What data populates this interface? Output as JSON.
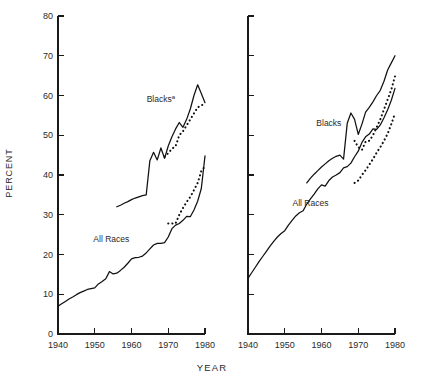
{
  "figure": {
    "width": 424,
    "height": 383,
    "background": "#ffffff",
    "ink_color": "#111111",
    "text_color": "#2a2a2a"
  },
  "axes": {
    "ylabel": "PERCENT",
    "xlabel": "YEAR",
    "ytick_labels": [
      "0",
      "10",
      "20",
      "30",
      "40",
      "50",
      "60",
      "70",
      "80"
    ],
    "xtick_labels": [
      "1940",
      "1950",
      "1960",
      "1970",
      "1980"
    ],
    "ylim": [
      0,
      80
    ],
    "xlim": [
      1940,
      1980
    ],
    "ystep": 10,
    "xstep": 10,
    "grid": false,
    "tick_side": "inside-left",
    "panels": 2
  },
  "geometry": {
    "left_panel": {
      "x0": 58,
      "x1": 205,
      "y_top": 16,
      "y_bottom": 334
    },
    "right_panel": {
      "x0": 248,
      "x1": 395,
      "y_top": 16,
      "y_bottom": 334
    },
    "tick_length": 6
  },
  "chart_data": {
    "type": "line",
    "title": "",
    "subtitle": "",
    "xlabel": "YEAR",
    "ylabel": "PERCENT",
    "xlim": [
      1940,
      1980
    ],
    "ylim": [
      0,
      80
    ],
    "grid": false,
    "legend": "inline-annotations",
    "panels": [
      {
        "panel_id": "left",
        "panel_label": "",
        "annotations": [
          {
            "text": "Blacks",
            "superscript": "a",
            "x": 1968.0,
            "y": 59.0
          },
          {
            "text": "All Races",
            "superscript": "",
            "x": 1954.5,
            "y": 24.0
          }
        ],
        "series": [
          {
            "name": "All Races",
            "style": "solid",
            "x": [
              1940,
              1941,
              1942,
              1943,
              1944,
              1945,
              1946,
              1947,
              1948,
              1949,
              1950,
              1951,
              1952,
              1953,
              1954,
              1955,
              1956,
              1957,
              1958,
              1959,
              1960,
              1961,
              1962,
              1963,
              1964,
              1965,
              1966,
              1967,
              1968,
              1969,
              1970,
              1971,
              1972,
              1973,
              1974,
              1975,
              1976,
              1977,
              1978,
              1979,
              1980
            ],
            "y": [
              7.0,
              7.6,
              8.2,
              8.8,
              9.3,
              9.9,
              10.4,
              10.8,
              11.2,
              11.4,
              11.6,
              12.6,
              13.2,
              13.9,
              15.7,
              15.1,
              15.3,
              16.0,
              16.8,
              17.8,
              18.9,
              19.2,
              19.3,
              19.6,
              20.4,
              21.4,
              22.4,
              22.8,
              22.8,
              23.0,
              24.4,
              26.5,
              27.4,
              27.8,
              28.6,
              29.6,
              29.5,
              31.2,
              33.4,
              36.6,
              44.8
            ]
          },
          {
            "name": "All Races (alternate/revised)",
            "style": "dotted",
            "x": [
              1970,
              1971,
              1972,
              1973,
              1974,
              1975,
              1976,
              1977,
              1978,
              1979,
              1980
            ],
            "y": [
              27.8,
              27.8,
              27.8,
              30.0,
              31.7,
              33.2,
              34.5,
              36.2,
              38.0,
              41.0,
              42.2
            ]
          },
          {
            "name": "Blacks",
            "style": "solid",
            "x": [
              1956,
              1957,
              1958,
              1959,
              1960,
              1961,
              1962,
              1963,
              1964,
              1965,
              1966,
              1967,
              1968,
              1969,
              1970,
              1971,
              1972,
              1973,
              1974,
              1975,
              1976,
              1977,
              1978,
              1979,
              1980
            ],
            "y": [
              32.0,
              32.4,
              32.9,
              33.3,
              33.8,
              34.2,
              34.5,
              34.8,
              35.0,
              43.6,
              45.7,
              43.8,
              46.8,
              44.2,
              47.3,
              49.6,
              51.6,
              53.2,
              52.0,
              54.0,
              56.6,
              60.0,
              62.7,
              60.5,
              58.2
            ]
          },
          {
            "name": "Blacks (alternate/revised)",
            "style": "dotted",
            "x": [
              1969,
              1970,
              1971,
              1972,
              1973,
              1974,
              1975,
              1976,
              1977,
              1978,
              1979,
              1980
            ],
            "y": [
              44.6,
              45.5,
              46.6,
              47.2,
              50.0,
              51.0,
              52.5,
              54.0,
              55.5,
              57.0,
              57.6,
              57.6
            ]
          }
        ]
      },
      {
        "panel_id": "right",
        "panel_label": "",
        "annotations": [
          {
            "text": "Blacks",
            "superscript": "",
            "x": 1962.0,
            "y": 53.0
          },
          {
            "text": "All Races",
            "superscript": "",
            "x": 1957.0,
            "y": 33.0
          }
        ],
        "series": [
          {
            "name": "All Races",
            "style": "solid",
            "x": [
              1940,
              1941,
              1942,
              1943,
              1944,
              1945,
              1946,
              1947,
              1948,
              1949,
              1950,
              1951,
              1952,
              1953,
              1954,
              1955,
              1956,
              1957,
              1958,
              1959,
              1960,
              1961,
              1962,
              1963,
              1964,
              1965,
              1966,
              1967,
              1968,
              1969,
              1970,
              1971,
              1972,
              1973,
              1974,
              1975,
              1976,
              1977,
              1978,
              1979,
              1980
            ],
            "y": [
              14.0,
              15.4,
              16.8,
              18.2,
              19.5,
              20.8,
              22.1,
              23.3,
              24.4,
              25.3,
              26.0,
              27.4,
              28.6,
              29.7,
              30.5,
              31.0,
              32.7,
              34.0,
              35.2,
              36.5,
              37.5,
              37.2,
              38.6,
              39.5,
              40.0,
              40.6,
              41.8,
              42.1,
              43.0,
              44.6,
              46.0,
              48.2,
              49.6,
              50.3,
              51.6,
              51.5,
              52.6,
              54.4,
              56.4,
              58.8,
              61.8
            ]
          },
          {
            "name": "All Races (alternate/revised)",
            "style": "dotted",
            "x": [
              1969,
              1970,
              1971,
              1972,
              1973,
              1974,
              1975,
              1976,
              1977,
              1978,
              1979,
              1980
            ],
            "y": [
              38.0,
              38.6,
              40.0,
              41.2,
              42.6,
              44.0,
              45.6,
              47.0,
              48.6,
              50.4,
              52.8,
              55.5
            ]
          },
          {
            "name": "Blacks",
            "style": "solid",
            "x": [
              1956,
              1957,
              1958,
              1959,
              1960,
              1961,
              1962,
              1963,
              1964,
              1965,
              1966,
              1967,
              1968,
              1969,
              1970,
              1971,
              1972,
              1973,
              1974,
              1975,
              1976,
              1977,
              1978,
              1979,
              1980
            ],
            "y": [
              38.0,
              39.2,
              40.2,
              41.1,
              42.0,
              42.8,
              43.6,
              44.2,
              44.7,
              45.0,
              44.0,
              53.0,
              55.6,
              54.0,
              50.2,
              52.8,
              55.8,
              57.0,
              58.4,
              60.0,
              61.3,
              63.6,
              66.4,
              68.2,
              70.0
            ]
          },
          {
            "name": "Blacks (alternate/revised)",
            "style": "dotted",
            "x": [
              1969,
              1970,
              1971,
              1972,
              1973,
              1974,
              1975,
              1976,
              1977,
              1978,
              1979,
              1980
            ],
            "y": [
              48.6,
              47.0,
              46.3,
              48.4,
              48.6,
              50.0,
              52.0,
              54.0,
              56.5,
              59.0,
              61.5,
              64.8
            ]
          }
        ]
      }
    ]
  }
}
